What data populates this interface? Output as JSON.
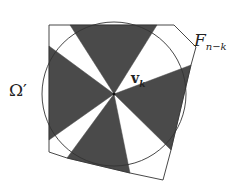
{
  "diagram": {
    "labels": {
      "omega": "Ω′",
      "face_main": "F",
      "face_sub": "n−k",
      "vertex_main": "v",
      "vertex_sub": "k"
    },
    "colors": {
      "fill": "#4a4a4a",
      "stroke": "#333333",
      "background": "#ffffff"
    },
    "circle": {
      "cx": 114,
      "cy": 94,
      "r": 72
    },
    "center": [
      114,
      94
    ]
  }
}
